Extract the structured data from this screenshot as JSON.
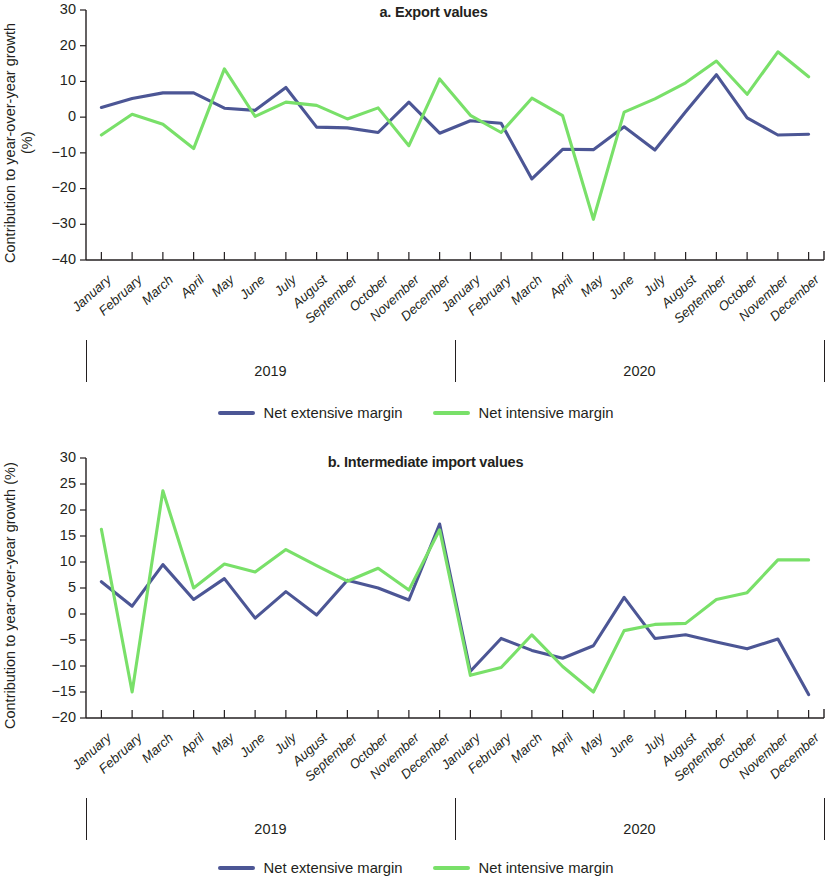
{
  "figure": {
    "ylabel": "Contribution to year-over-year growth (%)",
    "colors": {
      "net_extensive": "#4c5695",
      "net_intensive": "#79e069",
      "axis": "#231f20"
    },
    "legend": {
      "extensive_label": "Net extensive margin",
      "intensive_label": "Net intensive margin"
    },
    "years": [
      "2019",
      "2020"
    ],
    "months": [
      "January",
      "February",
      "March",
      "April",
      "May",
      "June",
      "July",
      "August",
      "September",
      "October",
      "November",
      "December"
    ]
  },
  "chart_data": [
    {
      "id": "panel-a",
      "type": "line",
      "title": "a. Export values",
      "xlabel": "",
      "ylabel": "Contribution to year-over-year growth (%)",
      "ylim": [
        -40,
        30
      ],
      "yticks": [
        30,
        20,
        10,
        0,
        -10,
        -20,
        -30,
        -40
      ],
      "ytick_labels": [
        "30",
        "20",
        "10",
        "0",
        "−10",
        "−20",
        "−30",
        "−40"
      ],
      "grid": false,
      "legend_position": "bottom",
      "x": [
        "2019-January",
        "2019-February",
        "2019-March",
        "2019-April",
        "2019-May",
        "2019-June",
        "2019-July",
        "2019-August",
        "2019-September",
        "2019-October",
        "2019-November",
        "2019-December",
        "2020-January",
        "2020-February",
        "2020-March",
        "2020-April",
        "2020-May",
        "2020-June",
        "2020-July",
        "2020-August",
        "2020-September",
        "2020-October",
        "2020-November",
        "2020-December"
      ],
      "categories": [
        "January",
        "February",
        "March",
        "April",
        "May",
        "June",
        "July",
        "August",
        "September",
        "October",
        "November",
        "December",
        "January",
        "February",
        "March",
        "April",
        "May",
        "June",
        "July",
        "August",
        "September",
        "October",
        "November",
        "December"
      ],
      "series": [
        {
          "name": "Net extensive margin",
          "color": "#4c5695",
          "values": [
            2.7,
            5.2,
            6.8,
            6.8,
            2.5,
            1.9,
            8.3,
            -2.8,
            -3.0,
            -4.3,
            4.2,
            -4.5,
            -1.0,
            -1.7,
            -17.3,
            -9.0,
            -9.1,
            -2.7,
            -9.2,
            1.5,
            11.9,
            -0.2,
            -5.0,
            -4.8
          ]
        },
        {
          "name": "Net intensive margin",
          "color": "#79e069",
          "values": [
            -5.0,
            0.8,
            -2.0,
            -8.8,
            13.5,
            0.2,
            4.2,
            3.3,
            -0.5,
            2.6,
            -8.0,
            10.7,
            0.5,
            -4.3,
            5.3,
            0.4,
            -28.6,
            1.4,
            5.1,
            9.6,
            15.7,
            6.4,
            18.3,
            11.3
          ]
        }
      ]
    },
    {
      "id": "panel-b",
      "type": "line",
      "title": "b. Intermediate import values",
      "xlabel": "",
      "ylabel": "Contribution to year-over-year growth (%)",
      "ylim": [
        -20,
        30
      ],
      "yticks": [
        30,
        25,
        20,
        15,
        10,
        5,
        0,
        -5,
        -10,
        -15,
        -20
      ],
      "ytick_labels": [
        "30",
        "25",
        "20",
        "15",
        "10",
        "5",
        "0",
        "−5",
        "−10",
        "−15",
        "−20"
      ],
      "grid": false,
      "legend_position": "bottom",
      "x": [
        "2019-January",
        "2019-February",
        "2019-March",
        "2019-April",
        "2019-May",
        "2019-June",
        "2019-July",
        "2019-August",
        "2019-September",
        "2019-October",
        "2019-November",
        "2019-December",
        "2020-January",
        "2020-February",
        "2020-March",
        "2020-April",
        "2020-May",
        "2020-June",
        "2020-July",
        "2020-August",
        "2020-September",
        "2020-October",
        "2020-November",
        "2020-December"
      ],
      "categories": [
        "January",
        "February",
        "March",
        "April",
        "May",
        "June",
        "July",
        "August",
        "September",
        "October",
        "November",
        "December",
        "January",
        "February",
        "March",
        "April",
        "May",
        "June",
        "July",
        "August",
        "September",
        "October",
        "November",
        "December"
      ],
      "series": [
        {
          "name": "Net extensive margin",
          "color": "#4c5695",
          "values": [
            6.2,
            1.5,
            9.5,
            2.8,
            6.8,
            -0.8,
            4.3,
            -0.2,
            6.5,
            5.0,
            2.7,
            17.3,
            -11.0,
            -4.7,
            -7.0,
            -8.5,
            -6.1,
            3.2,
            -4.7,
            -4.0,
            -5.4,
            -6.7,
            -4.8,
            -15.5
          ]
        },
        {
          "name": "Net intensive margin",
          "color": "#79e069",
          "values": [
            16.3,
            -15.0,
            23.7,
            5.0,
            9.6,
            8.1,
            12.4,
            9.3,
            6.3,
            8.8,
            4.6,
            16.2,
            -11.8,
            -10.3,
            -4.0,
            -10.1,
            -15.0,
            -3.2,
            -2.0,
            -1.8,
            2.8,
            4.1,
            10.4,
            10.4
          ]
        }
      ]
    }
  ]
}
